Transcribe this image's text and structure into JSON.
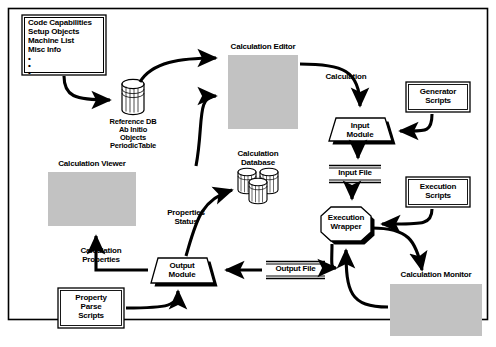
{
  "diagram": {
    "frame": {
      "border_color": "#000000",
      "background": "#ffffff"
    },
    "palette": {
      "stroke": "#000000",
      "screenshot_fill": "#c2c2c2",
      "shape_fill": "#ffffff",
      "shadow": "#000000"
    },
    "nodes": [
      {
        "id": "capabilities-list",
        "type": "double-box",
        "lines": [
          "Code Capabilities",
          "Setup Objects",
          "Machine List",
          "Misc Info"
        ],
        "bullets": [
          "•",
          "•",
          "•"
        ]
      },
      {
        "id": "reference-db",
        "type": "cylinder",
        "caption": [
          "Reference DB",
          "Ab Initio",
          "Objects",
          "PeriodicTable"
        ]
      },
      {
        "id": "calculation-editor",
        "type": "screenshot",
        "caption": "Calculation Editor"
      },
      {
        "id": "calculation-database",
        "type": "cylinder-group",
        "caption": [
          "Calculation",
          "Database"
        ]
      },
      {
        "id": "calculation-viewer",
        "type": "screenshot",
        "caption": "Calculation Viewer"
      },
      {
        "id": "input-module",
        "type": "trapezoid",
        "label": [
          "Input",
          "Module"
        ]
      },
      {
        "id": "generator-scripts",
        "type": "double-box",
        "label": [
          "Generator",
          "Scripts"
        ]
      },
      {
        "id": "execution-scripts",
        "type": "double-box",
        "label": [
          "Execution",
          "Scripts"
        ]
      },
      {
        "id": "execution-wrapper",
        "type": "octagon",
        "label": [
          "Execution",
          "Wrapper"
        ]
      },
      {
        "id": "calculation-monitor",
        "type": "screenshot",
        "caption": "Calculation Monitor"
      },
      {
        "id": "output-module",
        "type": "trapezoid",
        "label": [
          "Output",
          "Module"
        ]
      },
      {
        "id": "property-parse-scripts",
        "type": "double-box",
        "label": [
          "Property",
          "Parse",
          "Scripts"
        ]
      },
      {
        "id": "input-file",
        "type": "file-label",
        "label": "Input File"
      },
      {
        "id": "output-file",
        "type": "file-label",
        "label": "Output File"
      }
    ],
    "edge_labels": [
      {
        "id": "calculation-edge-label",
        "text": "Calculation"
      },
      {
        "id": "properties-status-edge-label",
        "text": [
          "Properties",
          "Status"
        ]
      },
      {
        "id": "calculation-properties-edge-label",
        "text": [
          "Calculation",
          "Properties"
        ]
      }
    ]
  },
  "labels": {
    "capabilities_line1": "Code Capabilities",
    "capabilities_line2": "Setup Objects",
    "capabilities_line3": "Machine List",
    "capabilities_line4": "Misc Info",
    "bullet": "•",
    "reference_db_l1": "Reference DB",
    "reference_db_l2": "Ab Initio",
    "reference_db_l3": "Objects",
    "reference_db_l4": "PeriodicTable",
    "calculation_editor": "Calculation Editor",
    "calculation_database_l1": "Calculation",
    "calculation_database_l2": "Database",
    "calculation_viewer": "Calculation Viewer",
    "calculation_monitor": "Calculation Monitor",
    "input_module_l1": "Input",
    "input_module_l2": "Module",
    "output_module_l1": "Output",
    "output_module_l2": "Module",
    "generator_scripts_l1": "Generator",
    "generator_scripts_l2": "Scripts",
    "execution_scripts_l1": "Execution",
    "execution_scripts_l2": "Scripts",
    "execution_wrapper_l1": "Execution",
    "execution_wrapper_l2": "Wrapper",
    "property_parse_l1": "Property",
    "property_parse_l2": "Parse",
    "property_parse_l3": "Scripts",
    "input_file": "Input File",
    "output_file": "Output File",
    "calculation_edge": "Calculation",
    "properties_status_l1": "Properties",
    "properties_status_l2": "Status",
    "calculation_properties_l1": "Calculation",
    "calculation_properties_l2": "Properties"
  }
}
